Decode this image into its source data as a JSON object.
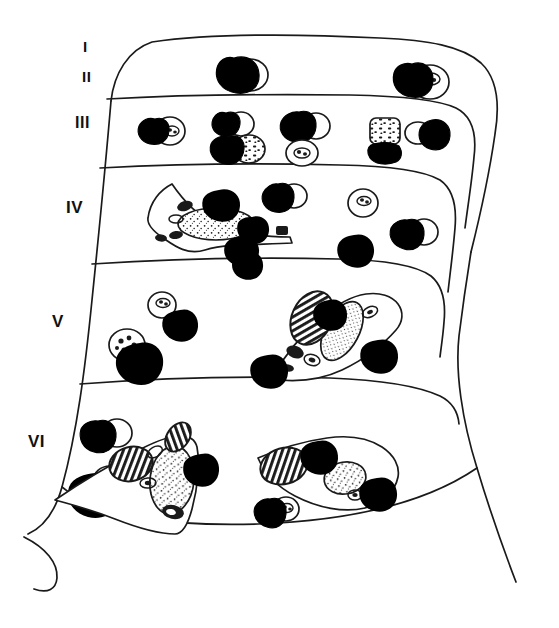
{
  "figure": {
    "ink_color": "#1a1a1a",
    "background_color": "#ffffff",
    "nucleus_fill": "#ffffff",
    "glia_fill": "#000000"
  },
  "labels": {
    "layer_1": "I",
    "layer_2": "II",
    "layer_3": "III",
    "layer_4": "IV",
    "layer_5": "V",
    "layer_6": "VI"
  },
  "layers": [
    {
      "id": "I",
      "label": "I",
      "y_top": 40,
      "y_bottom": 97,
      "cell_count": 2
    },
    {
      "id": "II",
      "label": "II",
      "y_top": 97,
      "y_bottom": 166,
      "cell_count": 0
    },
    {
      "id": "III",
      "label": "III",
      "y_top": 97,
      "y_bottom": 166,
      "cell_count": 7
    },
    {
      "id": "IV",
      "label": "IV",
      "y_top": 166,
      "y_bottom": 262,
      "cell_count": 4
    },
    {
      "id": "V",
      "label": "V",
      "y_top": 262,
      "y_bottom": 382,
      "cell_count": 6
    },
    {
      "id": "VI",
      "label": "VI",
      "y_top": 382,
      "y_bottom": 520,
      "cell_count": 8
    }
  ],
  "boundaries": {
    "outer_top": 40,
    "div_I_II": 97,
    "div_III_IV": 166,
    "div_IV_V": 262,
    "div_V_VI": 382,
    "outer_bottom": 520
  },
  "legend_note": "Dark masses = satellite glial cells; open outlines = neuronal perikarya with stippled nuclei"
}
